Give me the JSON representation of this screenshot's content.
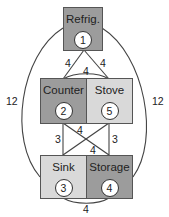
{
  "colors": {
    "dark_fill": "#9c9c9c",
    "light_fill": "#d9d9d9",
    "line": "#444444"
  },
  "nodes": [
    {
      "id": 1,
      "label": "Refrig.",
      "number": "1",
      "fill": "dark"
    },
    {
      "id": 2,
      "label": "Counter",
      "number": "2",
      "fill": "dark"
    },
    {
      "id": 5,
      "label": "Stove",
      "number": "5",
      "fill": "light"
    },
    {
      "id": 3,
      "label": "Sink",
      "number": "3",
      "fill": "light"
    },
    {
      "id": 4,
      "label": "Storage",
      "number": "4",
      "fill": "dark"
    }
  ],
  "edges": [
    {
      "from": "Refrig.",
      "to": "Counter",
      "weight": "4"
    },
    {
      "from": "Refrig.",
      "to": "Stove",
      "weight": "4"
    },
    {
      "from": "Counter",
      "to": "Stove",
      "weight": "4"
    },
    {
      "from": "Refrig.",
      "to": "Sink",
      "weight": "12"
    },
    {
      "from": "Refrig.",
      "to": "Storage",
      "weight": "12"
    },
    {
      "from": "Counter",
      "to": "Sink",
      "weight": "3"
    },
    {
      "from": "Stove",
      "to": "Storage",
      "weight": "3"
    },
    {
      "from": "Counter",
      "to": "Storage",
      "weight": "4"
    },
    {
      "from": "Stove",
      "to": "Sink",
      "weight": "4"
    },
    {
      "from": "Sink",
      "to": "Storage",
      "weight": "4"
    }
  ]
}
